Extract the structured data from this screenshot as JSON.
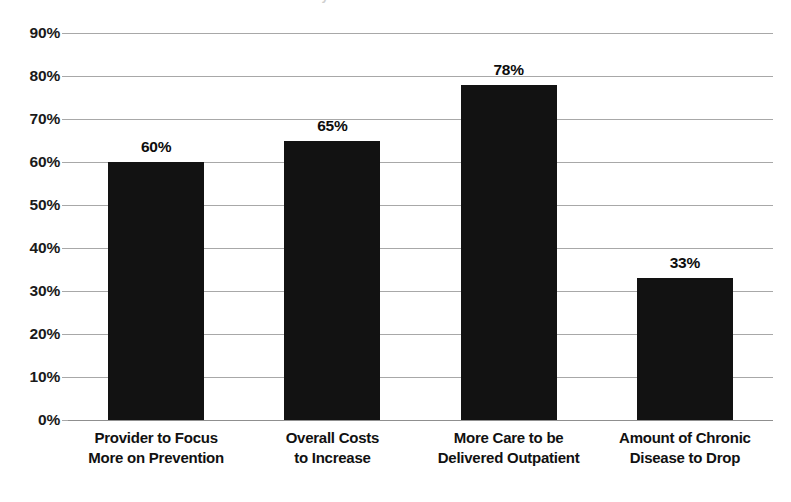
{
  "title_sliver": "Predictions for the Future of Healthcare Delivery",
  "chart_data": {
    "type": "bar",
    "title": "",
    "xlabel": "",
    "ylabel": "",
    "ylim": [
      0,
      90
    ],
    "grid": true,
    "legend": false,
    "categories": [
      "Provider to Focus More on Prevention",
      "Overall Costs to Increase",
      "More Care to be Delivered Outpatient",
      "Amount of Chronic Disease to Drop"
    ],
    "category_lines": [
      [
        "Provider to Focus",
        "More on Prevention"
      ],
      [
        "Overall Costs",
        "to Increase"
      ],
      [
        "More Care to be",
        "Delivered Outpatient"
      ],
      [
        "Amount of Chronic",
        "Disease to Drop"
      ]
    ],
    "values": [
      60,
      65,
      78,
      33
    ],
    "value_labels": [
      "60%",
      "65%",
      "78%",
      "33%"
    ],
    "yticks": [
      90,
      80,
      70,
      60,
      50,
      40,
      30,
      20,
      10,
      0
    ],
    "ytick_labels": [
      "90%",
      "80%",
      "70%",
      "60%",
      "50%",
      "40%",
      "30%",
      "20%",
      "10%",
      "0%"
    ],
    "colors": {
      "bar": "#121212",
      "gridline": "#a8a8a8",
      "background": "#ffffff",
      "text": "#111111"
    }
  }
}
